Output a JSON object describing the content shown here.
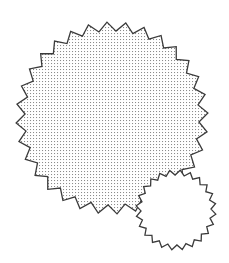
{
  "canvas": {
    "width": 229,
    "height": 263,
    "background_color": "#ffffff",
    "title": "overlapping-starburst-shapes"
  },
  "palette": {
    "stroke_color": "#3b3b3b",
    "hatch_dot_color": "#8c8c8c",
    "large_shape_fill": "#ffffff",
    "small_shape_fill": "#ffffff",
    "background": "#ffffff"
  },
  "shapes": [
    {
      "id": "large-starburst",
      "name": "large-starburst",
      "kind": "star-polygon",
      "points": 32,
      "center_x": 112,
      "center_y": 118,
      "outer_radius": 96,
      "inner_radius": 87,
      "rotation_deg": -3,
      "fill": "dotted-hatch",
      "fill_color": "#ffffff",
      "stroke_color": "#3b3b3b",
      "stroke_width": 1.3,
      "z_order": 1
    },
    {
      "id": "small-starburst",
      "name": "small-starburst",
      "kind": "star-polygon",
      "points": 24,
      "center_x": 176,
      "center_y": 210,
      "outer_radius": 40,
      "inner_radius": 35,
      "rotation_deg": 6,
      "fill": "solid",
      "fill_color": "#ffffff",
      "stroke_color": "#3b3b3b",
      "stroke_width": 1.3,
      "z_order": 2
    }
  ],
  "hatch": {
    "pattern_name": "fine-dot-grid",
    "tile_size": 3,
    "dot_color": "#8c8c8c",
    "dot_size": 1.05
  }
}
